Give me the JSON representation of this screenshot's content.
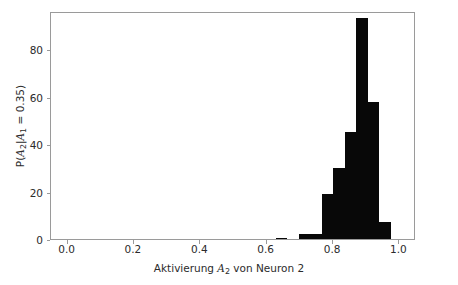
{
  "figure": {
    "background_color": "#ffffff",
    "frame_color": "#9a9a9a",
    "bar_color": "#080808",
    "text_color": "#2b2b2b"
  },
  "axes": {
    "x_title_parts": {
      "pre": "Aktivierung ",
      "var": "A",
      "sub": "2",
      "post": " von Neuron 2"
    },
    "x_title_plain": "Aktivierung A2 von Neuron 2",
    "y_title_parts": {
      "p1": "P(",
      "v1": "A",
      "s1": "2",
      "p2": "|",
      "v2": "A",
      "s2": "1",
      "p3": " = 0.35)"
    },
    "y_title_plain": "P(A2|A1 = 0.35)",
    "x_ticks": [
      "0.0",
      "0.2",
      "0.4",
      "0.6",
      "0.8",
      "1.0"
    ],
    "y_ticks": [
      "0",
      "20",
      "40",
      "60",
      "80"
    ]
  },
  "chart_data": {
    "type": "bar",
    "title": "",
    "subtitle": "",
    "xlabel": "Aktivierung A2 von Neuron 2",
    "ylabel": "P(A2|A1 = 0.35)",
    "xlim": [
      -0.05,
      1.05
    ],
    "ylim": [
      0,
      96
    ],
    "grid": false,
    "legend": "none",
    "bin_width": 0.0345,
    "bar_color": "#080808",
    "categories": [
      "0.645",
      "0.680",
      "0.714",
      "0.749",
      "0.783",
      "0.818",
      "0.852",
      "0.887",
      "0.921",
      "0.956"
    ],
    "values": [
      0.5,
      0,
      2,
      2,
      19,
      30,
      45,
      93,
      57.5,
      7
    ],
    "bars": [
      {
        "x_center": 0.645,
        "value": 0.5
      },
      {
        "x_center": 0.714,
        "value": 2
      },
      {
        "x_center": 0.749,
        "value": 2
      },
      {
        "x_center": 0.783,
        "value": 19
      },
      {
        "x_center": 0.818,
        "value": 30
      },
      {
        "x_center": 0.852,
        "value": 45
      },
      {
        "x_center": 0.887,
        "value": 93
      },
      {
        "x_center": 0.921,
        "value": 57.5
      },
      {
        "x_center": 0.956,
        "value": 7
      }
    ],
    "x_tick_values": [
      0.0,
      0.2,
      0.4,
      0.6,
      0.8,
      1.0
    ],
    "y_tick_values": [
      0,
      20,
      40,
      60,
      80
    ]
  }
}
